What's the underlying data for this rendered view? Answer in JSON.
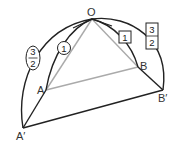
{
  "diagram": {
    "type": "geometry-figure",
    "points": {
      "O": "O",
      "A": "A",
      "B": "B",
      "A_prime": "A′",
      "B_prime": "B′"
    },
    "annotations": {
      "circle_label": "1",
      "square_label": "1",
      "oval_fraction": {
        "numerator": "3",
        "denominator": "2"
      },
      "rect_fraction": {
        "numerator": "3",
        "denominator": "2"
      }
    },
    "colors": {
      "stroke": "#222222",
      "gray_stroke": "#aaaaaa",
      "label": "#333333"
    }
  }
}
